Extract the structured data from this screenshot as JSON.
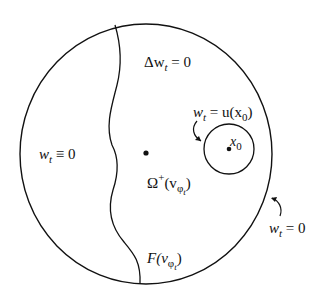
{
  "figure": {
    "stroke_color": "#111111",
    "background": "#ffffff",
    "labels": {
      "laplace": {
        "main": "Δw",
        "sub": "t",
        "rest": " = 0"
      },
      "left_region": {
        "main": "w",
        "sub": "t",
        "rest": " ≡ 0"
      },
      "small_circle_bc": {
        "main": "w",
        "sub": "t",
        "rest": " = u(x",
        "sub2": "0",
        "rest2": ")"
      },
      "x0": {
        "main": "x",
        "sub": "0"
      },
      "omega": {
        "main": "Ω",
        "sup": "+",
        "rest": "(v",
        "sub": "φ",
        "subsub": "t",
        "rest2": ")"
      },
      "free_boundary": {
        "main": "F(v",
        "sub": "φ",
        "subsub": "t",
        "rest": ")"
      },
      "outer_bc": {
        "main": "w",
        "sub": "t",
        "rest": " = 0"
      }
    }
  }
}
